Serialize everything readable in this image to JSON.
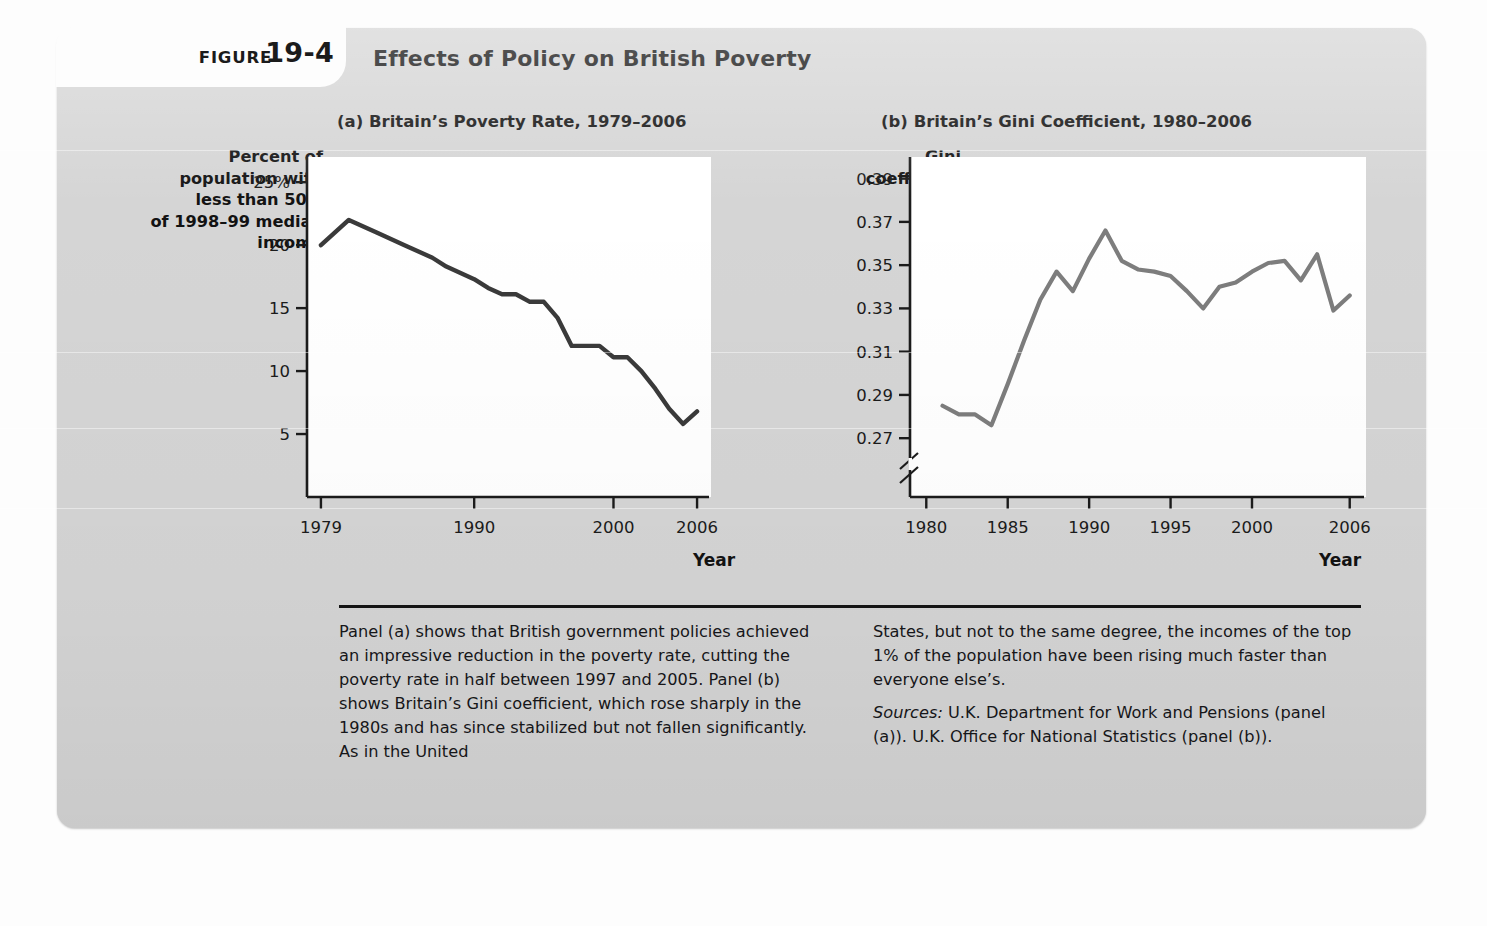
{
  "figure": {
    "tab_label": "FIGURE",
    "number": "19-4",
    "title": "Effects of Policy on British Poverty"
  },
  "panel_a": {
    "title": "(a) Britain’s Poverty Rate, 1979–2006",
    "y_axis_label": "Percent of\npopulation with\nless than 50%\nof 1998–99 median\nincome",
    "x_axis_title": "Year"
  },
  "panel_b": {
    "title": "(b) Britain’s Gini Coefficient, 1980–2006",
    "y_axis_label": "Gini\ncoefficient",
    "x_axis_title": "Year"
  },
  "caption": {
    "column_1": "Panel (a) shows that British government policies achieved an impressive reduction in the poverty rate, cutting the poverty rate in half between 1997 and 2005. Panel (b) shows Britain’s Gini coefficient, which rose sharply in the 1980s and has since stabilized but not fallen significantly. As in the United",
    "column_2": "States, but not to the same degree, the incomes of the top 1% of the population have been rising much faster than everyone else’s.",
    "sources_label": "Sources:",
    "sources_text": " U.K. Department for Work and Pensions (panel (a)). U.K. Office for National Statistics (panel (b))."
  },
  "colors": {
    "card_background": "#d5d5d5",
    "plot_background": "#ffffff",
    "axis": "#1b1b1b",
    "line_panel_a": "#3a3a3a",
    "line_panel_b": "#7d7d7d",
    "text": "#121212"
  },
  "chart_data": [
    {
      "id": "panel_a",
      "type": "line",
      "title": "(a) Britain’s Poverty Rate, 1979–2006",
      "xlabel": "Year",
      "ylabel": "Percent of population with less than 50% of 1998–99 median income",
      "xlim": [
        1978,
        2007
      ],
      "ylim": [
        0,
        27
      ],
      "x_ticks": [
        1979,
        1990,
        2000,
        2006
      ],
      "x_tick_labels": [
        "1979",
        "1990",
        "2000",
        "2006"
      ],
      "y_ticks": [
        5,
        10,
        15,
        20,
        25
      ],
      "y_tick_labels": [
        "5",
        "10",
        "15",
        "20",
        "25%"
      ],
      "grid": false,
      "legend": "none",
      "series": [
        {
          "name": "Poverty rate",
          "color": "#3a3a3a",
          "x": [
            1979,
            1981,
            1983,
            1985,
            1987,
            1988,
            1990,
            1991,
            1992,
            1993,
            1994,
            1995,
            1996,
            1997,
            1998,
            1999,
            2000,
            2001,
            2002,
            2003,
            2004,
            2005,
            2006
          ],
          "values": [
            20.0,
            22.0,
            21.0,
            20.0,
            19.0,
            18.3,
            17.3,
            16.6,
            16.1,
            16.1,
            15.5,
            15.5,
            14.2,
            12.0,
            12.0,
            12.0,
            11.1,
            11.1,
            10.0,
            8.6,
            7.0,
            5.8,
            6.8
          ]
        }
      ]
    },
    {
      "id": "panel_b",
      "type": "line",
      "title": "(b) Britain’s Gini Coefficient, 1980–2006",
      "xlabel": "Year",
      "ylabel": "Gini coefficient",
      "xlim": [
        1979,
        2007
      ],
      "ylim": [
        0.265,
        0.4
      ],
      "axis_break": true,
      "axis_break_note": "y-axis broken below 0.27",
      "x_ticks": [
        1980,
        1985,
        1990,
        1995,
        2000,
        2006
      ],
      "x_tick_labels": [
        "1980",
        "1985",
        "1990",
        "1995",
        "2000",
        "2006"
      ],
      "y_ticks": [
        0.27,
        0.29,
        0.31,
        0.33,
        0.35,
        0.37,
        0.39
      ],
      "y_tick_labels": [
        "0.27",
        "0.29",
        "0.31",
        "0.33",
        "0.35",
        "0.37",
        "0.39"
      ],
      "grid": false,
      "legend": "none",
      "series": [
        {
          "name": "Gini coefficient",
          "color": "#7d7d7d",
          "x": [
            1981,
            1982,
            1983,
            1984,
            1985,
            1986,
            1987,
            1988,
            1989,
            1990,
            1991,
            1992,
            1993,
            1994,
            1995,
            1996,
            1997,
            1998,
            1999,
            2000,
            2001,
            2002,
            2003,
            2004,
            2005,
            2006
          ],
          "values": [
            0.285,
            0.281,
            0.281,
            0.276,
            0.295,
            0.315,
            0.334,
            0.347,
            0.338,
            0.353,
            0.366,
            0.352,
            0.348,
            0.347,
            0.345,
            0.338,
            0.33,
            0.34,
            0.342,
            0.347,
            0.351,
            0.352,
            0.343,
            0.355,
            0.329,
            0.336
          ]
        }
      ]
    }
  ]
}
